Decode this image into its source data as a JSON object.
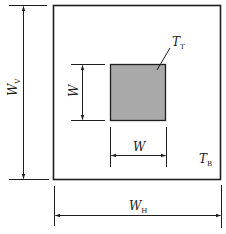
{
  "diagram": {
    "type": "dimensioned-drawing",
    "colors": {
      "line": "#1e1e1e",
      "inner_fill": "#a9a9a9",
      "background": "#ffffff"
    },
    "outer_box": {
      "label": "T",
      "label_sub": "B",
      "width_dimension": {
        "label": "W",
        "sub": "H"
      },
      "height_dimension": {
        "label": "W",
        "sub": "V"
      }
    },
    "inner_square": {
      "label": "T",
      "label_sub": "T",
      "width_dimension": {
        "label": "W"
      },
      "height_dimension": {
        "label": "W"
      }
    }
  }
}
